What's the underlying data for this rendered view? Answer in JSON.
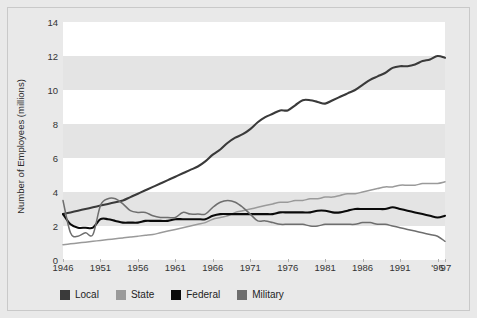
{
  "chart_data": {
    "type": "line",
    "title": "",
    "subtitle": "",
    "xlabel": "",
    "ylabel": "Number of Employees (millions)",
    "xlim": [
      1946,
      1997
    ],
    "ylim": [
      0,
      14
    ],
    "yticks": [
      0,
      2,
      4,
      6,
      8,
      10,
      12,
      14
    ],
    "xticks": [
      1946,
      1951,
      1956,
      1961,
      1966,
      1971,
      1976,
      1981,
      1986,
      1991,
      1996,
      1997
    ],
    "xtick_labels": [
      "1946",
      "1951",
      "1956",
      "1961",
      "1966",
      "1971",
      "1976",
      "1981",
      "1986",
      "1991",
      "'96",
      "'97"
    ],
    "grid": false,
    "banded_background": true,
    "band_interval": 2,
    "legend_position": "below",
    "series": [
      {
        "name": "Local",
        "color": "#3a3a3a",
        "x": [
          1946,
          1947,
          1948,
          1949,
          1950,
          1951,
          1952,
          1953,
          1954,
          1955,
          1956,
          1957,
          1958,
          1959,
          1960,
          1961,
          1962,
          1963,
          1964,
          1965,
          1966,
          1967,
          1968,
          1969,
          1970,
          1971,
          1972,
          1973,
          1974,
          1975,
          1976,
          1977,
          1978,
          1979,
          1980,
          1981,
          1982,
          1983,
          1984,
          1985,
          1986,
          1987,
          1988,
          1989,
          1990,
          1991,
          1992,
          1993,
          1994,
          1995,
          1996,
          1997
        ],
        "values": [
          2.7,
          2.8,
          2.9,
          3.0,
          3.1,
          3.2,
          3.3,
          3.4,
          3.5,
          3.7,
          3.9,
          4.1,
          4.3,
          4.5,
          4.7,
          4.9,
          5.1,
          5.3,
          5.5,
          5.8,
          6.2,
          6.5,
          6.9,
          7.2,
          7.4,
          7.7,
          8.1,
          8.4,
          8.6,
          8.8,
          8.8,
          9.1,
          9.4,
          9.4,
          9.3,
          9.2,
          9.4,
          9.6,
          9.8,
          10.0,
          10.3,
          10.6,
          10.8,
          11.0,
          11.3,
          11.4,
          11.4,
          11.5,
          11.7,
          11.8,
          12.0,
          11.9
        ],
        "end_value": 11.9
      },
      {
        "name": "State",
        "color": "#9a9a9a",
        "x": [
          1946,
          1947,
          1948,
          1949,
          1950,
          1951,
          1952,
          1953,
          1954,
          1955,
          1956,
          1957,
          1958,
          1959,
          1960,
          1961,
          1962,
          1963,
          1964,
          1965,
          1966,
          1967,
          1968,
          1969,
          1970,
          1971,
          1972,
          1973,
          1974,
          1975,
          1976,
          1977,
          1978,
          1979,
          1980,
          1981,
          1982,
          1983,
          1984,
          1985,
          1986,
          1987,
          1988,
          1989,
          1990,
          1991,
          1992,
          1993,
          1994,
          1995,
          1996,
          1997
        ],
        "values": [
          0.9,
          0.95,
          1.0,
          1.05,
          1.1,
          1.15,
          1.2,
          1.25,
          1.3,
          1.35,
          1.4,
          1.45,
          1.5,
          1.6,
          1.7,
          1.8,
          1.9,
          2.0,
          2.1,
          2.2,
          2.4,
          2.5,
          2.6,
          2.8,
          2.9,
          3.0,
          3.1,
          3.2,
          3.3,
          3.4,
          3.4,
          3.5,
          3.5,
          3.6,
          3.6,
          3.7,
          3.7,
          3.8,
          3.9,
          3.9,
          4.0,
          4.1,
          4.2,
          4.3,
          4.3,
          4.4,
          4.4,
          4.4,
          4.5,
          4.5,
          4.5,
          4.6
        ],
        "end_value": 4.6
      },
      {
        "name": "Federal",
        "color": "#0a0a0a",
        "x": [
          1946,
          1947,
          1948,
          1949,
          1950,
          1951,
          1952,
          1953,
          1954,
          1955,
          1956,
          1957,
          1958,
          1959,
          1960,
          1961,
          1962,
          1963,
          1964,
          1965,
          1966,
          1967,
          1968,
          1969,
          1970,
          1971,
          1972,
          1973,
          1974,
          1975,
          1976,
          1977,
          1978,
          1979,
          1980,
          1981,
          1982,
          1983,
          1984,
          1985,
          1986,
          1987,
          1988,
          1989,
          1990,
          1991,
          1992,
          1993,
          1994,
          1995,
          1996,
          1997
        ],
        "values": [
          2.7,
          2.1,
          1.9,
          1.9,
          1.9,
          2.4,
          2.4,
          2.3,
          2.2,
          2.2,
          2.2,
          2.3,
          2.3,
          2.3,
          2.3,
          2.4,
          2.4,
          2.4,
          2.4,
          2.4,
          2.6,
          2.7,
          2.7,
          2.7,
          2.7,
          2.7,
          2.7,
          2.7,
          2.7,
          2.8,
          2.8,
          2.8,
          2.8,
          2.8,
          2.9,
          2.9,
          2.8,
          2.8,
          2.9,
          3.0,
          3.0,
          3.0,
          3.0,
          3.0,
          3.1,
          3.0,
          2.9,
          2.8,
          2.7,
          2.6,
          2.5,
          2.6
        ],
        "end_value": 2.6
      },
      {
        "name": "Military",
        "color": "#6e6e6e",
        "x": [
          1946,
          1947,
          1948,
          1949,
          1950,
          1951,
          1952,
          1953,
          1954,
          1955,
          1956,
          1957,
          1958,
          1959,
          1960,
          1961,
          1962,
          1963,
          1964,
          1965,
          1966,
          1967,
          1968,
          1969,
          1970,
          1971,
          1972,
          1973,
          1974,
          1975,
          1976,
          1977,
          1978,
          1979,
          1980,
          1981,
          1982,
          1983,
          1984,
          1985,
          1986,
          1987,
          1988,
          1989,
          1990,
          1991,
          1992,
          1993,
          1994,
          1995,
          1996,
          1997
        ],
        "values": [
          3.5,
          1.6,
          1.4,
          1.6,
          1.5,
          3.2,
          3.6,
          3.6,
          3.3,
          2.9,
          2.8,
          2.8,
          2.6,
          2.5,
          2.5,
          2.5,
          2.8,
          2.7,
          2.7,
          2.7,
          3.1,
          3.4,
          3.5,
          3.4,
          3.1,
          2.7,
          2.3,
          2.3,
          2.2,
          2.1,
          2.1,
          2.1,
          2.1,
          2.0,
          2.0,
          2.1,
          2.1,
          2.1,
          2.1,
          2.1,
          2.2,
          2.2,
          2.1,
          2.1,
          2.0,
          1.9,
          1.8,
          1.7,
          1.6,
          1.5,
          1.4,
          1.1
        ],
        "end_value": 1.1
      }
    ]
  },
  "axis": {
    "ylabel": "Number of Employees (millions)",
    "ytick_labels": [
      "0",
      "2",
      "4",
      "6",
      "8",
      "10",
      "12",
      "14"
    ],
    "xtick_labels": [
      "1946",
      "1951",
      "1956",
      "1961",
      "1966",
      "1971",
      "1976",
      "1981",
      "1986",
      "1991",
      "'96",
      "'97"
    ]
  },
  "legend": {
    "items": [
      {
        "label": "Local",
        "color": "#3a3a3a"
      },
      {
        "label": "State",
        "color": "#9a9a9a"
      },
      {
        "label": "Federal",
        "color": "#0a0a0a"
      },
      {
        "label": "Military",
        "color": "#6e6e6e"
      }
    ]
  },
  "colors": {
    "figure_background": "#e9e9e9",
    "plot_background": "#ffffff",
    "band": "#e4e4e4",
    "frame_border": "#c9c9c9",
    "text": "#2b2b2b"
  }
}
